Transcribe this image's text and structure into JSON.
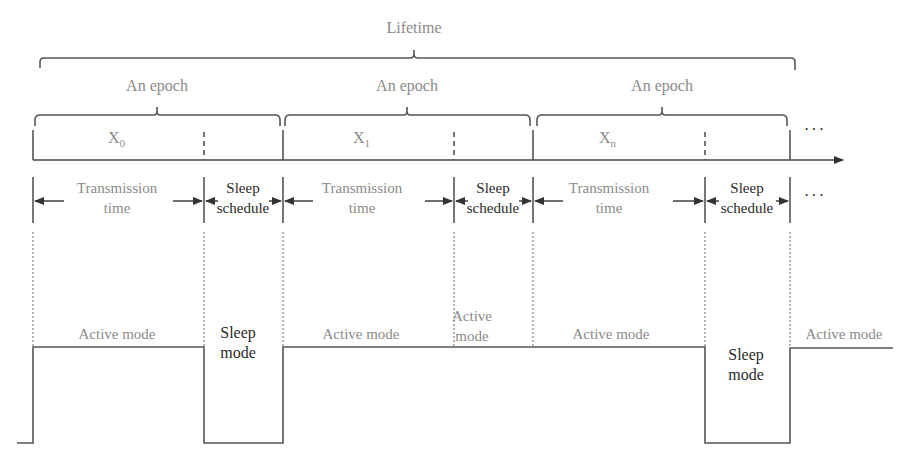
{
  "diagram": {
    "type": "timing-diagram",
    "colors": {
      "line": "#555555",
      "gray_text": "#8a8a8a",
      "dark_text": "#2a2a2a"
    },
    "lifetime_label": "Lifetime",
    "epochs": [
      {
        "label": "An epoch",
        "x_label": "X",
        "x_sub": "0"
      },
      {
        "label": "An epoch",
        "x_label": "X",
        "x_sub": "1"
      },
      {
        "label": "An epoch",
        "x_label": "X",
        "x_sub": "n"
      }
    ],
    "ellipsis": "···",
    "intervals": [
      {
        "transmission_line1": "Transmission",
        "transmission_line2": "time",
        "sleep_line1": "Sleep",
        "sleep_line2": "schedule"
      },
      {
        "transmission_line1": "Transmission",
        "transmission_line2": "time",
        "sleep_line1": "Sleep",
        "sleep_line2": "schedule"
      },
      {
        "transmission_line1": "Transmission",
        "transmission_line2": "time",
        "sleep_line1": "Sleep",
        "sleep_line2": "schedule"
      }
    ],
    "modes": {
      "active_1": "Active mode",
      "sleep_1_line1": "Sleep",
      "sleep_1_line2": "mode",
      "active_2": "Active mode",
      "active_short_line1": "Active",
      "active_short_line2": "mode",
      "active_3": "Active mode",
      "sleep_2_line1": "Sleep",
      "sleep_2_line2": "mode",
      "active_4": "Active mode"
    }
  }
}
